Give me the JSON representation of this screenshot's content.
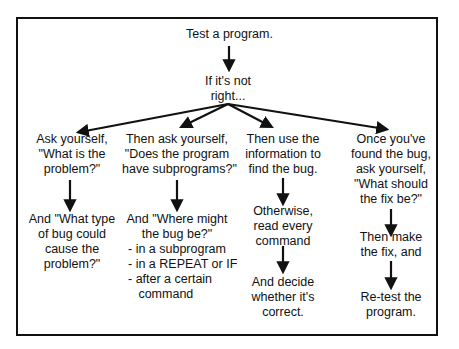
{
  "diagram": {
    "type": "flowchart",
    "root": {
      "text": "Test a program.",
      "next": "If it's not\nright..."
    },
    "branches": [
      {
        "steps": [
          "Ask yourself,\n\"What is the\nproblem?\"",
          "And \"What type\nof bug could\ncause the\nproblem?\""
        ]
      },
      {
        "steps": [
          "Then ask yourself,\n\"Does the program\nhave subprograms?\"",
          "And \"Where might\nthe bug be?\"",
          "- in a subprogram\n- in a REPEAT or IF\n- after a certain\n   command"
        ]
      },
      {
        "steps": [
          "Then use the\ninformation to\nfind the bug.",
          "Otherwise,\nread every\ncommand",
          "And decide\nwhether it's\ncorrect."
        ]
      },
      {
        "steps": [
          "Once you've\nfound the bug,\nask yourself,\n\"What should\nthe fix be?\"",
          "Then make\nthe fix, and",
          "Re-test the\nprogram."
        ]
      }
    ],
    "colors": {
      "line": "#111111",
      "background": "#ffffff"
    }
  }
}
